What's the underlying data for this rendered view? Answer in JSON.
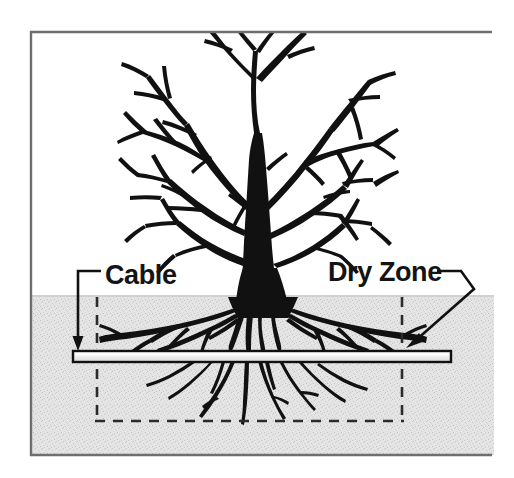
{
  "figure": {
    "background_color": "#ffffff",
    "frame_color": "#6e6e6e",
    "soil_color": "#e3e3e3",
    "soil_speckle_color": "#c9c9c9",
    "ink_color": "#111111",
    "cable_fill_color": "#efefef"
  },
  "labels": {
    "cable": "Cable",
    "dry_zone": "Dry Zone"
  },
  "annotations": {
    "cable_leader": {
      "name": "cable-leader-arrow",
      "description": "horizontal leader from Cable text bending down with arrowhead onto the cable"
    },
    "dry_zone_leader": {
      "name": "dry-zone-leader-arrow",
      "description": "leader from Dry Zone text bending down-left with arrowhead onto the right dry-zone boundary"
    }
  },
  "elements": {
    "tree": "deciduous-tree-silhouette",
    "roots": "root-system-silhouette",
    "cable": "buried-horizontal-cable",
    "soil": "soil-region",
    "ground_line": "ground-surface-line",
    "dry_zone_boundary": "dashed-dry-zone-rectangle"
  },
  "geometry": {
    "frame": {
      "x": 30,
      "y": 31,
      "width": 462,
      "height": 425
    },
    "ground_line_y": 296,
    "cable": {
      "x1": 73,
      "x2": 451,
      "y": 356,
      "thickness": 11
    },
    "dry_zone_dashes": {
      "left_x": 97,
      "right_x": 402,
      "top_y": 297,
      "bottom_y": 421
    }
  }
}
